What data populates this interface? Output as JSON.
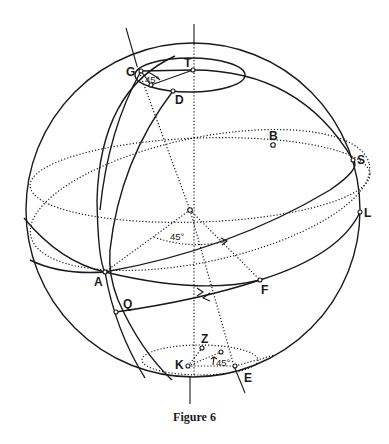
{
  "figure": {
    "caption": "Figure 6",
    "points": {
      "T": "T",
      "G": "G",
      "D": "D",
      "B": "B",
      "S": "S",
      "L": "L",
      "A": "A",
      "F": "F",
      "Q": "Q",
      "Z": "Z",
      "K": "K",
      "E": "E"
    },
    "angles": {
      "top": "45°",
      "center": "45°",
      "bottom": "45°"
    }
  }
}
